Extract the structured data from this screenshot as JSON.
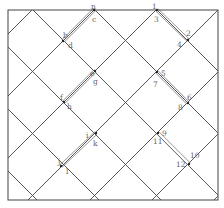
{
  "diagram": {
    "box": {
      "x1": 8,
      "y1": 10,
      "x2": 218,
      "y2": 200
    },
    "colors": {
      "line": "#444444",
      "highlight": "#888888",
      "label": "#666666",
      "background": "#ffffff"
    },
    "diag_down_offsets": [
      -209,
      -147,
      -85,
      -23,
      39,
      101,
      163
    ],
    "diag_up_offsets": [
      42,
      104,
      166,
      228,
      290,
      352,
      414
    ],
    "highlighted_segments": [
      {
        "from": "n",
        "to": "b"
      },
      {
        "from": "e",
        "to": "f"
      },
      {
        "from": "i",
        "to": "j"
      },
      {
        "from": "1",
        "to": "2"
      },
      {
        "from": "5",
        "to": "6"
      },
      {
        "from": "9",
        "to": "10"
      }
    ],
    "points": [
      {
        "id": "nc",
        "x": 94,
        "y": 10
      },
      {
        "id": "bd",
        "x": 63,
        "y": 41
      },
      {
        "id": "eg",
        "x": 95,
        "y": 71
      },
      {
        "id": "fh",
        "x": 64,
        "y": 102
      },
      {
        "id": "ik",
        "x": 96,
        "y": 133
      },
      {
        "id": "jl",
        "x": 61,
        "y": 166
      },
      {
        "id": "13",
        "x": 157,
        "y": 10
      },
      {
        "id": "24",
        "x": 188,
        "y": 40
      },
      {
        "id": "57",
        "x": 157,
        "y": 72
      },
      {
        "id": "68",
        "x": 188,
        "y": 103
      },
      {
        "id": "911",
        "x": 158,
        "y": 133
      },
      {
        "id": "1012",
        "x": 189,
        "y": 164
      }
    ],
    "labels": [
      {
        "text": "n",
        "x": 91,
        "y": 6
      },
      {
        "text": "c",
        "x": 92,
        "y": 19
      },
      {
        "text": "b",
        "x": 63,
        "y": 35
      },
      {
        "text": "d",
        "x": 68,
        "y": 45
      },
      {
        "text": "e",
        "x": 90,
        "y": 73
      },
      {
        "text": "g",
        "x": 93,
        "y": 81
      },
      {
        "text": "f",
        "x": 60,
        "y": 97
      },
      {
        "text": "h",
        "x": 67,
        "y": 106
      },
      {
        "text": "i",
        "x": 86,
        "y": 135
      },
      {
        "text": "k",
        "x": 93,
        "y": 143
      },
      {
        "text": "j",
        "x": 58,
        "y": 161
      },
      {
        "text": "l",
        "x": 66,
        "y": 171
      },
      {
        "text": "1",
        "x": 152,
        "y": 6
      },
      {
        "text": "3",
        "x": 154,
        "y": 19
      },
      {
        "text": "2",
        "x": 186,
        "y": 33
      },
      {
        "text": "4",
        "x": 177,
        "y": 44
      },
      {
        "text": "5",
        "x": 161,
        "y": 73
      },
      {
        "text": "7",
        "x": 153,
        "y": 84
      },
      {
        "text": "6",
        "x": 187,
        "y": 97
      },
      {
        "text": "8",
        "x": 178,
        "y": 107
      },
      {
        "text": "9",
        "x": 162,
        "y": 133
      },
      {
        "text": "11",
        "x": 153,
        "y": 141
      },
      {
        "text": "10",
        "x": 190,
        "y": 155
      },
      {
        "text": "12",
        "x": 176,
        "y": 164
      }
    ]
  }
}
